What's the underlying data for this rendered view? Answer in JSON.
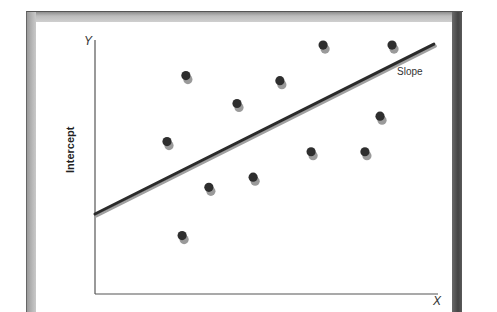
{
  "chart_data": {
    "type": "scatter",
    "title": "",
    "xlabel": "X",
    "ylabel": "Y",
    "y_axis_annotation": "Intercept",
    "line_annotation": "Slope",
    "xlim": [
      0,
      10
    ],
    "ylim": [
      0,
      10
    ],
    "grid": false,
    "legend": null,
    "points": [
      {
        "x": 2.65,
        "y": 8.6
      },
      {
        "x": 4.14,
        "y": 7.5
      },
      {
        "x": 5.39,
        "y": 8.4
      },
      {
        "x": 6.65,
        "y": 9.8
      },
      {
        "x": 8.66,
        "y": 9.8
      },
      {
        "x": 2.1,
        "y": 6.0
      },
      {
        "x": 3.32,
        "y": 4.2
      },
      {
        "x": 4.61,
        "y": 4.6
      },
      {
        "x": 6.3,
        "y": 5.6
      },
      {
        "x": 7.87,
        "y": 5.6
      },
      {
        "x": 8.31,
        "y": 7.0
      },
      {
        "x": 2.54,
        "y": 2.3
      }
    ],
    "regression_line": {
      "x0": 0,
      "y0": 3.15,
      "x1": 9.88,
      "y1": 9.84,
      "slope": 0.68,
      "intercept": 3.15
    }
  },
  "labels": {
    "y_axis": "Y",
    "x_axis": "X",
    "intercept": "Intercept",
    "slope": "Slope"
  },
  "colors": {
    "point": "#2e2e2e",
    "point_shadow": "#9a9a9a",
    "line": "#2a2a2a",
    "line_shadow": "#a0a0a0",
    "axis": "#555555"
  }
}
